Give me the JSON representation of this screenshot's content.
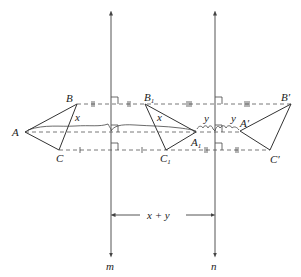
{
  "figure": {
    "lines": {
      "m": {
        "label": "m",
        "x": 111
      },
      "n": {
        "label": "n",
        "x": 215
      }
    },
    "triangles": {
      "original": {
        "A": "A",
        "B": "B",
        "C": "C"
      },
      "first_image": {
        "A": "A",
        "A_sub": "1",
        "B": "B",
        "B_sub": "1",
        "C": "C",
        "C_sub": "1"
      },
      "final_image": {
        "A": "A′",
        "B": "B′",
        "C": "C′"
      }
    },
    "distance_labels": {
      "x_left": "x",
      "x_right": "x",
      "y_left": "y",
      "y_right": "y",
      "total": "x + y"
    }
  }
}
